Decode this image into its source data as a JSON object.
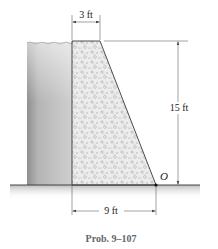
{
  "figure": {
    "caption": "Prob. 9–107",
    "point_label": "O",
    "dimensions": {
      "top_width": "3 ft",
      "height": "15 ft",
      "base_width": "9 ft"
    }
  },
  "colors": {
    "water_top": "#d9d9d9",
    "water_bottom": "#8f8f8f",
    "concrete_fill": "#e6e6e6",
    "line": "#222222",
    "ground_shadow": "#c8c8c8",
    "caption": "#666666"
  }
}
